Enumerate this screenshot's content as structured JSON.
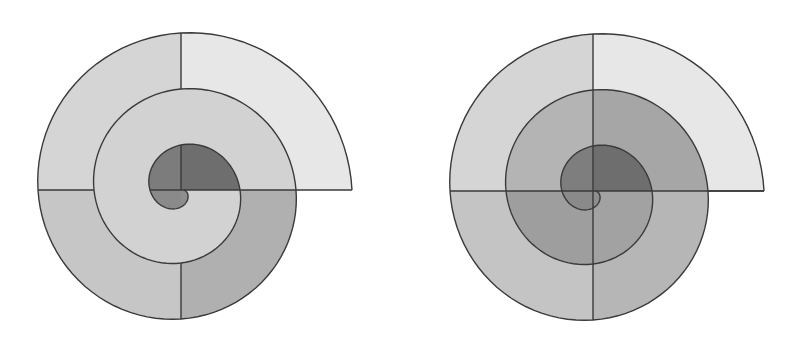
{
  "title": "",
  "spiral_model": {
    "type": "archimedean",
    "r0": 3,
    "growth_per_quarter": 14,
    "quarters": 12,
    "stroke": "#3a3a3a",
    "stroke_width": 1.4
  },
  "figures": [
    {
      "id": "left",
      "label": "Spiral partitioned into quarter-turn bands (spokes only between bands)",
      "center": [
        181,
        190
      ],
      "full_spokes": false,
      "band_colors": {
        "turn0": [
          "#6e6e6e",
          "#7c7c7c",
          "#8a8a8a",
          "#8e8e8e"
        ],
        "turn1": [
          "#d2d2d2",
          "#d2d2d2",
          "#d2d2d2",
          "#d2d2d2"
        ],
        "turn2": [
          "#e7e7e7",
          "#d5d5d5",
          "#c6c6c6",
          "#b0b0b0"
        ]
      }
    },
    {
      "id": "right",
      "label": "Spiral partitioned by full horizontal and vertical spokes",
      "center": [
        192,
        191
      ],
      "full_spokes": true,
      "band_colors": {
        "turn0": [
          "#6e6e6e",
          "#7e7e7e",
          "#8a8a8a",
          "#8e8e8e"
        ],
        "turn1": [
          "#a6a6a6",
          "#b4b4b4",
          "#9e9e9e",
          "#a2a2a2"
        ],
        "turn2": [
          "#e7e7e7",
          "#d5d5d5",
          "#c4c4c4",
          "#b6b6b6"
        ]
      }
    }
  ]
}
